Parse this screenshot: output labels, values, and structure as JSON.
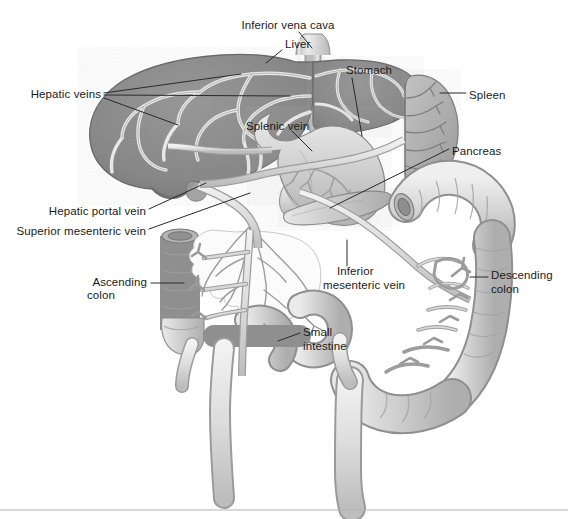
{
  "figure": {
    "kind": "anatomical-diagram",
    "background_color": "#ffffff",
    "divider_color": "#b4b4b8"
  },
  "palette": {
    "liver_fill": "#8d8d8d",
    "liver_edge": "#6f6f6f",
    "vessel_light": "#e6e6e6",
    "vessel_stroke": "#9a9a9a",
    "organ_fill": "#cfcfcf",
    "organ_light": "#ededed",
    "organ_edge": "#8f8f8f",
    "spleen_fill": "#b6b6b6",
    "mesentery_fill": "#fbfbfb",
    "label_text": "#1b1b1b",
    "leader_line": "#2a2a2a"
  },
  "labels": [
    {
      "id": "inferior-vena-cava",
      "text": "Inferior vena cava",
      "x": 288,
      "y": 26,
      "align": "center"
    },
    {
      "id": "liver",
      "text": "Liver",
      "x": 285,
      "y": 45,
      "align": "left"
    },
    {
      "id": "hepatic-veins",
      "text": "Hepatic veins",
      "x": 101,
      "y": 95,
      "align": "right"
    },
    {
      "id": "stomach",
      "text": "Stomach",
      "x": 346,
      "y": 71,
      "align": "left"
    },
    {
      "id": "spleen",
      "text": "Spleen",
      "x": 469,
      "y": 96,
      "align": "left"
    },
    {
      "id": "splenic-vein",
      "text": "Splenic vein",
      "x": 246,
      "y": 127,
      "align": "left"
    },
    {
      "id": "pancreas",
      "text": "Pancreas",
      "x": 452,
      "y": 152,
      "align": "left"
    },
    {
      "id": "hepatic-portal-vein",
      "text": "Hepatic portal vein",
      "x": 146,
      "y": 212,
      "align": "right"
    },
    {
      "id": "superior-mesenteric-vein",
      "text": "Superior mesenteric vein",
      "x": 146,
      "y": 232,
      "align": "right"
    },
    {
      "id": "ascending-colon-1",
      "text": "Ascending",
      "x": 147,
      "y": 283,
      "align": "right"
    },
    {
      "id": "ascending-colon-2",
      "text": "colon",
      "x": 87,
      "y": 296,
      "align": "left"
    },
    {
      "id": "inferior-mesenteric-vein-1",
      "text": "Inferior",
      "x": 337,
      "y": 272,
      "align": "left"
    },
    {
      "id": "inferior-mesenteric-vein-2",
      "text": "mesenteric vein",
      "x": 323,
      "y": 286,
      "align": "left"
    },
    {
      "id": "descending-colon-1",
      "text": "Descending",
      "x": 491,
      "y": 276,
      "align": "left"
    },
    {
      "id": "descending-colon-2",
      "text": "colon",
      "x": 491,
      "y": 290,
      "align": "left"
    },
    {
      "id": "small-intestine-1",
      "text": "Small",
      "x": 303,
      "y": 333,
      "align": "left"
    },
    {
      "id": "small-intestine-2",
      "text": "intestine",
      "x": 303,
      "y": 347,
      "align": "left"
    }
  ],
  "structures": [
    {
      "id": "liver",
      "name": "Liver"
    },
    {
      "id": "inferior-vena-cava",
      "name": "Inferior vena cava"
    },
    {
      "id": "hepatic-veins",
      "name": "Hepatic veins"
    },
    {
      "id": "stomach",
      "name": "Stomach"
    },
    {
      "id": "spleen",
      "name": "Spleen"
    },
    {
      "id": "splenic-vein",
      "name": "Splenic vein"
    },
    {
      "id": "pancreas",
      "name": "Pancreas"
    },
    {
      "id": "hepatic-portal-vein",
      "name": "Hepatic portal vein"
    },
    {
      "id": "superior-mesenteric-vein",
      "name": "Superior mesenteric vein"
    },
    {
      "id": "inferior-mesenteric-vein",
      "name": "Inferior mesenteric vein"
    },
    {
      "id": "ascending-colon",
      "name": "Ascending colon"
    },
    {
      "id": "descending-colon",
      "name": "Descending colon"
    },
    {
      "id": "transverse-colon",
      "name": "Transverse colon"
    },
    {
      "id": "small-intestine",
      "name": "Small intestine"
    },
    {
      "id": "mesentery",
      "name": "Mesentery"
    }
  ]
}
